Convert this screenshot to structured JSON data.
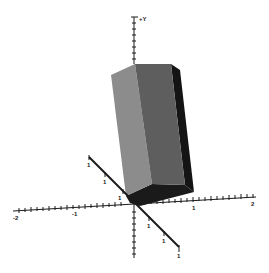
{
  "diagram": {
    "axes": {
      "y": {
        "label": "+Y"
      },
      "x": {
        "labels": [
          "-2",
          "-1",
          "1",
          "2"
        ]
      },
      "z": {
        "labels": [
          "1",
          "1",
          "1",
          "1",
          "1",
          "1"
        ]
      }
    },
    "prism": {
      "faces": [
        {
          "name": "left-face",
          "color": "#8c8c8c"
        },
        {
          "name": "front-face",
          "color": "#5e5e5e"
        },
        {
          "name": "right-face",
          "color": "#141414"
        },
        {
          "name": "bottom-face",
          "color": "#1a1a1a"
        }
      ]
    },
    "colors": {
      "axis": "#1a1a1a",
      "background": "#ffffff"
    }
  }
}
